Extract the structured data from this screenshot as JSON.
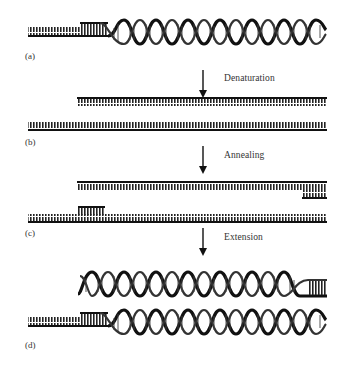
{
  "figure": {
    "panels": [
      {
        "label": "(a)",
        "description": "double-stranded DNA template"
      },
      {
        "label": "(b)",
        "description": "separated single strands"
      },
      {
        "label": "(c)",
        "description": "primers annealed to single strands"
      },
      {
        "label": "(d)",
        "description": "two double-stranded DNA copies"
      }
    ],
    "steps": [
      {
        "label": "Denaturation"
      },
      {
        "label": "Annealing"
      },
      {
        "label": "Extension"
      }
    ],
    "colors": {
      "strand": "#1a1a1a",
      "text": "#333333",
      "background": "#ffffff"
    }
  }
}
